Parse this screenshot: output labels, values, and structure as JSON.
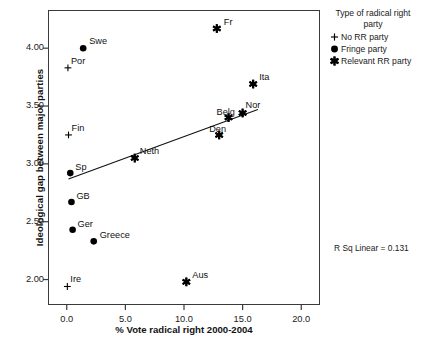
{
  "chart_data": {
    "type": "scatter",
    "title": "",
    "xlabel": "% Vote radical right 2000-2004",
    "ylabel": "Ideological gap between major parties",
    "xlim": [
      -1.6,
      21.6
    ],
    "ylim": [
      1.78,
      4.33
    ],
    "xticks": [
      "0.0",
      "5.0",
      "10.0",
      "15.0",
      "20.0"
    ],
    "xtick_values": [
      0.0,
      5.0,
      10.0,
      15.0,
      20.0
    ],
    "yticks": [
      "2.00",
      "2.50",
      "3.00",
      "3.50",
      "4.00"
    ],
    "ytick_values": [
      2.0,
      2.5,
      3.0,
      3.5,
      4.0
    ],
    "grid": false,
    "annotation": "R Sq Linear = 0.131",
    "r_sq_linear": 0.131,
    "fit_line": {
      "type": "linear",
      "x_start": 0.15,
      "y_start": 2.87,
      "x_end": 16.3,
      "y_end": 3.47
    },
    "points": [
      {
        "label": "Fr",
        "x": 12.8,
        "y": 4.17,
        "group": "Relevant RR party",
        "marker": "asterisk",
        "label_dx": 7,
        "label_dy": -12
      },
      {
        "label": "Swe",
        "x": 1.4,
        "y": 4.0,
        "group": "Fringe party",
        "marker": "circle",
        "label_dx": 6,
        "label_dy": -12
      },
      {
        "label": "Por",
        "x": 0.1,
        "y": 3.83,
        "group": "No RR party",
        "marker": "plus",
        "label_dx": 3,
        "label_dy": -12
      },
      {
        "label": "Ita",
        "x": 15.9,
        "y": 3.69,
        "group": "Relevant RR party",
        "marker": "asterisk",
        "label_dx": 6,
        "label_dy": -12
      },
      {
        "label": "Nor",
        "x": 15.0,
        "y": 3.44,
        "group": "Relevant RR party",
        "marker": "asterisk",
        "label_dx": 3,
        "label_dy": -13
      },
      {
        "label": "Belg",
        "x": 13.8,
        "y": 3.4,
        "group": "Relevant RR party",
        "marker": "asterisk",
        "label_dx": -12,
        "label_dy": -11
      },
      {
        "label": "Fin",
        "x": 0.15,
        "y": 3.25,
        "group": "No RR party",
        "marker": "plus",
        "label_dx": 3,
        "label_dy": -12
      },
      {
        "label": "Den",
        "x": 13.0,
        "y": 3.25,
        "group": "Relevant RR party",
        "marker": "asterisk",
        "label_dx": -10,
        "label_dy": -11
      },
      {
        "label": "Neth",
        "x": 5.8,
        "y": 3.05,
        "group": "Relevant RR party",
        "marker": "asterisk",
        "label_dx": 5,
        "label_dy": -12
      },
      {
        "label": "Sp",
        "x": 0.3,
        "y": 2.92,
        "group": "Fringe party",
        "marker": "circle",
        "label_dx": 5,
        "label_dy": -11
      },
      {
        "label": "GB",
        "x": 0.4,
        "y": 2.67,
        "group": "Fringe party",
        "marker": "circle",
        "label_dx": 5,
        "label_dy": -11
      },
      {
        "label": "Ger",
        "x": 0.5,
        "y": 2.43,
        "group": "Fringe party",
        "marker": "circle",
        "label_dx": 5,
        "label_dy": -11
      },
      {
        "label": "Greece",
        "x": 2.3,
        "y": 2.33,
        "group": "Fringe party",
        "marker": "circle",
        "label_dx": 6,
        "label_dy": -11
      },
      {
        "label": "Aus",
        "x": 10.2,
        "y": 1.98,
        "group": "Relevant RR party",
        "marker": "asterisk",
        "label_dx": 6,
        "label_dy": -12
      },
      {
        "label": "Ire",
        "x": 0.05,
        "y": 1.94,
        "group": "No RR party",
        "marker": "plus",
        "label_dx": 3,
        "label_dy": -12
      }
    ]
  },
  "legend": {
    "title": "Type of radical right party",
    "items": [
      {
        "marker": "plus",
        "label": "No RR party"
      },
      {
        "marker": "circle",
        "label": "Fringe party"
      },
      {
        "marker": "asterisk",
        "label": "Relevant RR party"
      }
    ]
  },
  "colors": {
    "ink": "#111111",
    "axis": "#3a3a3a",
    "marker": "#000000",
    "background": "#ffffff"
  }
}
